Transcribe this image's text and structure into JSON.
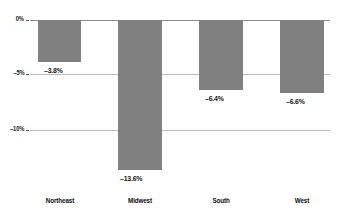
{
  "chart_data": {
    "type": "bar",
    "title": "",
    "subtitle": "",
    "xlabel": "",
    "ylabel": "",
    "categories": [
      "Northeast",
      "Midwest",
      "South",
      "West"
    ],
    "values": [
      -3.8,
      -13.6,
      -6.4,
      -6.6
    ],
    "value_labels": [
      "–3.8%",
      "–13.6%",
      "–6.4%",
      "–6.6%"
    ],
    "ylim": [
      -15.5,
      0
    ],
    "yticks": [
      0,
      -5,
      -10
    ],
    "ytick_labels": [
      "0%",
      "–5%",
      "–10%"
    ],
    "grid": true,
    "legend": "none",
    "series": [
      {
        "name": "Percent change",
        "values": [
          -3.8,
          -13.6,
          -6.4,
          -6.6
        ]
      }
    ],
    "colors": {
      "bar_fill": "#808080",
      "gridline": "#b9b9b9",
      "zero_line": "#8c8c8c",
      "text": "#131313",
      "background": "#ffffff"
    }
  }
}
